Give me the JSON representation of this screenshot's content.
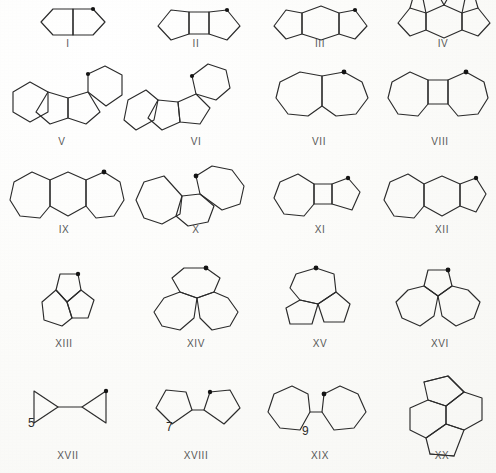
{
  "plate": {
    "title": "Polycyclic hydrocarbon skeletal structures plate",
    "background_color": "#fdfdfb",
    "line_color": "#2b2b2b",
    "mark_color": "#141414",
    "label_color": "#3a3a3a",
    "width": 496,
    "height": 473,
    "rows": 5,
    "columns": 4,
    "structure_count": 20
  },
  "structures": [
    {
      "id": "I",
      "label": "I",
      "row": 1,
      "column": 1,
      "description": "cis-bicyclo[3.3.0]octane, two fused five-membered rings",
      "ring_sizes": [
        5,
        5
      ],
      "has_dot_marker": true,
      "annotation": "",
      "label_x": 68,
      "label_y": 43,
      "origin_x": 30,
      "origin_y": 4
    },
    {
      "id": "II",
      "label": "II",
      "row": 1,
      "column": 2,
      "description": "two five-membered rings fused to a central four-membered ring",
      "ring_sizes": [
        5,
        4,
        5
      ],
      "has_dot_marker": true,
      "annotation": "",
      "label_x": 196,
      "label_y": 43,
      "origin_x": 152,
      "origin_y": 4
    },
    {
      "id": "III",
      "label": "III",
      "row": 1,
      "column": 3,
      "description": "two five-membered rings fused to a central six-membered ring",
      "ring_sizes": [
        5,
        6,
        5
      ],
      "has_dot_marker": true,
      "annotation": "",
      "label_x": 320,
      "label_y": 43,
      "origin_x": 268,
      "origin_y": 4
    },
    {
      "id": "IV",
      "label": "IV",
      "row": 1,
      "column": 4,
      "description": "tetracyclic system, central six-ring with fused five-rings, top partly cropped by plate edge",
      "ring_sizes": [
        5,
        6,
        5,
        5
      ],
      "has_dot_marker": false,
      "annotation": "",
      "label_x": 443,
      "label_y": 43,
      "origin_x": 392,
      "origin_y": 0
    },
    {
      "id": "V",
      "label": "V",
      "row": 2,
      "column": 1,
      "description": "angular tetracyclic, two six-rings flanking two fused five-rings",
      "ring_sizes": [
        6,
        5,
        5,
        6
      ],
      "has_dot_marker": true,
      "annotation": "",
      "label_x": 62,
      "label_y": 140,
      "origin_x": 8,
      "origin_y": 62
    },
    {
      "id": "VI",
      "label": "VI",
      "row": 2,
      "column": 2,
      "description": "angular tetracyclic isomer, tilted arrangement of six- and five-rings",
      "ring_sizes": [
        6,
        5,
        5,
        6
      ],
      "has_dot_marker": true,
      "annotation": "",
      "label_x": 193,
      "label_y": 140,
      "origin_x": 126,
      "origin_y": 62
    },
    {
      "id": "VII",
      "label": "VII",
      "row": 2,
      "column": 3,
      "description": "bicyclic, two fused seven-membered rings",
      "ring_sizes": [
        7,
        7
      ],
      "has_dot_marker": true,
      "annotation": "",
      "label_x": 319,
      "label_y": 140,
      "origin_x": 270,
      "origin_y": 66
    },
    {
      "id": "VIII",
      "label": "VIII",
      "row": 2,
      "column": 4,
      "description": "two seven-membered rings fused to a central four-membered ring",
      "ring_sizes": [
        7,
        4,
        7
      ],
      "has_dot_marker": true,
      "annotation": "",
      "label_x": 440,
      "label_y": 140,
      "origin_x": 384,
      "origin_y": 66
    },
    {
      "id": "IX",
      "label": "IX",
      "row": 3,
      "column": 1,
      "description": "two seven-membered rings fused to a central six-membered ring",
      "ring_sizes": [
        7,
        6,
        7
      ],
      "has_dot_marker": true,
      "annotation": "",
      "label_x": 64,
      "label_y": 228,
      "origin_x": 8,
      "origin_y": 166
    },
    {
      "id": "X",
      "label": "X",
      "row": 3,
      "column": 2,
      "description": "angular tricyclic, two seven-rings joined through a central six-ring",
      "ring_sizes": [
        7,
        6,
        7
      ],
      "has_dot_marker": true,
      "annotation": "",
      "label_x": 193,
      "label_y": 228,
      "origin_x": 134,
      "origin_y": 166
    },
    {
      "id": "XI",
      "label": "XI",
      "row": 3,
      "column": 3,
      "description": "seven-membered ring and five-membered ring fused to a central four-membered ring",
      "ring_sizes": [
        7,
        4,
        5
      ],
      "has_dot_marker": true,
      "annotation": "",
      "label_x": 320,
      "label_y": 228,
      "origin_x": 272,
      "origin_y": 170
    },
    {
      "id": "XII",
      "label": "XII",
      "row": 3,
      "column": 4,
      "description": "seven-membered ring and five-membered ring fused to a central six-membered ring",
      "ring_sizes": [
        7,
        6,
        5
      ],
      "has_dot_marker": true,
      "annotation": "",
      "label_x": 442,
      "label_y": 228,
      "origin_x": 382,
      "origin_y": 170
    },
    {
      "id": "XIII",
      "label": "XIII",
      "row": 4,
      "column": 1,
      "description": "triquinacene-like tricyclic cage of three fused five-membered rings",
      "ring_sizes": [
        5,
        5,
        5
      ],
      "has_dot_marker": true,
      "annotation": "",
      "label_x": 64,
      "label_y": 342,
      "origin_x": 34,
      "origin_y": 268
    },
    {
      "id": "XIV",
      "label": "XIV",
      "row": 4,
      "column": 2,
      "description": "three fused seven-membered rings arranged about a central carbon",
      "ring_sizes": [
        7,
        7,
        7
      ],
      "has_dot_marker": true,
      "annotation": "",
      "label_x": 196,
      "label_y": 342,
      "origin_x": 144,
      "origin_y": 268
    },
    {
      "id": "XV",
      "label": "XV",
      "row": 4,
      "column": 3,
      "description": "one seven-membered ring and two five-membered rings fused about a central carbon",
      "ring_sizes": [
        7,
        5,
        5
      ],
      "has_dot_marker": true,
      "annotation": "",
      "label_x": 318,
      "label_y": 342,
      "origin_x": 274,
      "origin_y": 268
    },
    {
      "id": "XVI",
      "label": "XVI",
      "row": 4,
      "column": 4,
      "description": "one five-membered ring and two seven-membered rings fused about a central carbon",
      "ring_sizes": [
        5,
        7,
        7
      ],
      "has_dot_marker": true,
      "annotation": "",
      "label_x": 440,
      "label_y": 342,
      "origin_x": 388,
      "origin_y": 268
    },
    {
      "id": "XVII",
      "label": "XVII",
      "row": 5,
      "column": 1,
      "description": "bicyclopropyl, two three-membered rings joined by a single bond",
      "ring_sizes": [
        3,
        3
      ],
      "has_dot_marker": true,
      "annotation": "5",
      "annotation_x": 32,
      "annotation_y": 424,
      "label_x": 68,
      "label_y": 455,
      "origin_x": 22,
      "origin_y": 386
    },
    {
      "id": "XVIII",
      "label": "XVIII",
      "row": 5,
      "column": 2,
      "description": "bicyclopentyl, two five-membered rings joined by a single bond",
      "ring_sizes": [
        5,
        5
      ],
      "has_dot_marker": true,
      "annotation": "7",
      "annotation_x": 170,
      "annotation_y": 428,
      "label_x": 196,
      "label_y": 455,
      "origin_x": 148,
      "origin_y": 386
    },
    {
      "id": "XIX",
      "label": "XIX",
      "row": 5,
      "column": 3,
      "description": "bicycloheptyl, two seven-membered rings joined by a single bond",
      "ring_sizes": [
        7,
        7
      ],
      "has_dot_marker": true,
      "annotation": "9",
      "annotation_x": 306,
      "annotation_y": 432,
      "label_x": 320,
      "label_y": 455,
      "origin_x": 266,
      "origin_y": 386
    },
    {
      "id": "XX",
      "label": "XX",
      "row": 5,
      "column": 4,
      "description": "tetracyclic fused system, two five-rings and two six-rings sharing a central bond",
      "ring_sizes": [
        5,
        6,
        6,
        5
      ],
      "has_dot_marker": false,
      "annotation": "",
      "label_x": 442,
      "label_y": 455,
      "origin_x": 398,
      "origin_y": 378
    }
  ]
}
